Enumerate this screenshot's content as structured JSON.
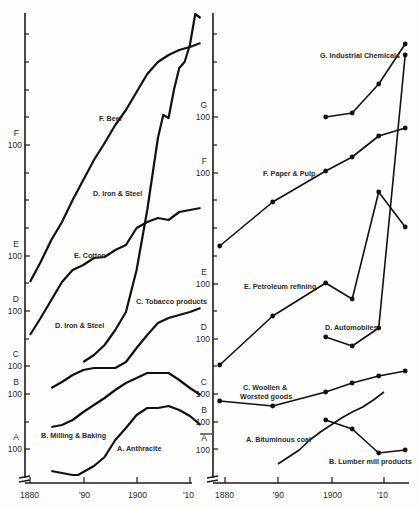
{
  "chart_data": [
    {
      "type": "line",
      "panel": "left",
      "title": "",
      "xlabel": "",
      "x_ticks": [
        "1880",
        "'90",
        "1900",
        "'10"
      ],
      "y_axis": "logarithmic, separate 100 baselines per series",
      "y_ticks": [
        "A 100",
        "B 100",
        "C 100",
        "D 100",
        "E 100",
        "F 100"
      ],
      "series": [
        {
          "name": "F. Beer",
          "letter": "F",
          "x": [
            1880,
            1882,
            1884,
            1886,
            1888,
            1890,
            1892,
            1894,
            1896,
            1898,
            1900,
            1902,
            1904,
            1906,
            1908,
            1910,
            1912
          ],
          "px_y": [
            282,
            262,
            240,
            222,
            200,
            180,
            160,
            143,
            125,
            110,
            92,
            74,
            62,
            55,
            50,
            47,
            43
          ]
        },
        {
          "name": "D. Iron & Steel",
          "letter": "D",
          "x": [
            1890,
            1892,
            1894,
            1896,
            1898,
            1900,
            1902,
            1904,
            1905,
            1906,
            1907,
            1908,
            1909,
            1910,
            1911,
            1912
          ],
          "px_y": [
            362,
            355,
            345,
            330,
            312,
            270,
            210,
            138,
            115,
            118,
            90,
            68,
            62,
            45,
            14,
            18
          ]
        },
        {
          "name": "E. Cotton",
          "letter": "E",
          "x": [
            1880,
            1882,
            1884,
            1886,
            1888,
            1890,
            1892,
            1894,
            1896,
            1898,
            1900,
            1902,
            1904,
            1906,
            1908,
            1910,
            1912
          ],
          "px_y": [
            335,
            318,
            300,
            282,
            270,
            265,
            258,
            257,
            250,
            245,
            228,
            222,
            218,
            220,
            212,
            210,
            208
          ]
        },
        {
          "name": "C. Tobacco products",
          "letter": "C",
          "x": [
            1884,
            1886,
            1888,
            1890,
            1892,
            1894,
            1896,
            1898,
            1900,
            1902,
            1904,
            1906,
            1908,
            1910,
            1912
          ],
          "px_y": [
            388,
            382,
            375,
            370,
            368,
            368,
            368,
            362,
            348,
            335,
            323,
            318,
            315,
            312,
            308
          ]
        },
        {
          "name": "B. Milling & Baking",
          "letter": "B",
          "x": [
            1884,
            1886,
            1888,
            1890,
            1892,
            1894,
            1896,
            1898,
            1900,
            1902,
            1904,
            1906,
            1908,
            1910,
            1912
          ],
          "px_y": [
            427,
            425,
            420,
            412,
            405,
            398,
            390,
            383,
            378,
            373,
            373,
            373,
            380,
            388,
            395
          ]
        },
        {
          "name": "A. Anthracite",
          "letter": "A",
          "x": [
            1884,
            1886,
            1888,
            1889,
            1890,
            1892,
            1894,
            1896,
            1898,
            1900,
            1902,
            1904,
            1906,
            1908,
            1910,
            1912
          ],
          "px_y": [
            471,
            473,
            475,
            475,
            472,
            466,
            457,
            440,
            428,
            415,
            408,
            408,
            406,
            410,
            416,
            425
          ]
        }
      ]
    },
    {
      "type": "line",
      "panel": "right",
      "title": "",
      "xlabel": "",
      "x_ticks": [
        "1880",
        "'90",
        "1900",
        "'10"
      ],
      "y_axis": "logarithmic, separate 100 baselines per series",
      "y_ticks": [
        "A 100",
        "B 100",
        "C 100",
        "D 100",
        "E 100",
        "F 100",
        "G 100"
      ],
      "series": [
        {
          "name": "G. Industrial Chemicals",
          "letter": "G",
          "x": [
            1899,
            1904,
            1909,
            1914
          ],
          "px_y": [
            117,
            113,
            84,
            44
          ]
        },
        {
          "name": "F. Paper & Pulp",
          "letter": "F",
          "x": [
            1879,
            1889,
            1899,
            1904,
            1909,
            1914
          ],
          "px_y": [
            246,
            202,
            171,
            157,
            136,
            128
          ]
        },
        {
          "name": "E. Petroleum refining",
          "letter": "E",
          "x": [
            1879,
            1889,
            1899,
            1904,
            1909,
            1914
          ],
          "px_y": [
            365,
            316,
            283,
            299,
            192,
            227
          ]
        },
        {
          "name": "D. Automobiles",
          "letter": "D",
          "x": [
            1899,
            1904,
            1909,
            1914
          ],
          "px_y": [
            337,
            346,
            328,
            55
          ]
        },
        {
          "name": "C. Woollen & Worsted goods",
          "letter": "C",
          "x": [
            1879,
            1889,
            1899,
            1904,
            1909,
            1914
          ],
          "px_y": [
            401,
            406,
            392,
            383,
            376,
            371
          ]
        },
        {
          "name": "A. Bituminous coal",
          "letter": "A",
          "x": [
            1890,
            1892,
            1894,
            1896,
            1898,
            1900,
            1902,
            1904,
            1906,
            1908,
            1910
          ],
          "px_y": [
            464,
            457,
            450,
            440,
            432,
            425,
            418,
            412,
            407,
            400,
            392
          ]
        },
        {
          "name": "B. Lumber mill products",
          "letter": "B",
          "x": [
            1899,
            1904,
            1909,
            1914
          ],
          "px_y": [
            420,
            429,
            453,
            450
          ]
        }
      ]
    }
  ],
  "labels": {
    "left": {
      "beer": "F. Beer",
      "iron_top": "D. Iron & Steel",
      "cotton": "E. Cotton",
      "tobacco": "C. Tobacco products",
      "iron_bottom": "D. Iron & Steel",
      "milling": "B. Milling & Baking",
      "anthracite": "A. Anthracite"
    },
    "right": {
      "chemicals": "G. Industrial Chemicals",
      "paper": "F. Paper & Pulp",
      "petroleum": "E. Petroleum refining",
      "autos": "D. Automobiles",
      "woollen1": "C. Woollen &",
      "woollen2": "Worsted goods",
      "bituminous": "A. Bituminous coal",
      "lumber": "B. Lumber mill products"
    }
  },
  "x_axis": {
    "t1880": "1880",
    "t90": "'90",
    "t1900": "1900",
    "t10": "'10"
  },
  "y_axis": {
    "hundred": "100",
    "A": "A",
    "B": "B",
    "C": "C",
    "D": "D",
    "E": "E",
    "F": "F",
    "G": "G"
  }
}
